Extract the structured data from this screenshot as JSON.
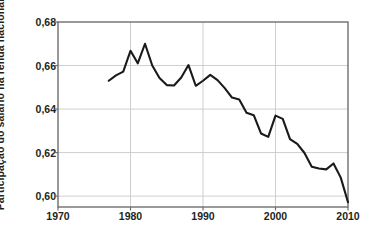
{
  "chart_data": {
    "type": "line",
    "title": "",
    "subtitle": "",
    "xlabel": "",
    "ylabel": "Participação do salário na renda nacional",
    "xlim": [
      1970,
      2010
    ],
    "ylim": [
      0.595,
      0.68
    ],
    "xticks": [
      1970,
      1980,
      1990,
      2000,
      2010
    ],
    "xtick_labels": [
      "1970",
      "1980",
      "1990",
      "2000",
      "2010"
    ],
    "yticks": [
      0.6,
      0.62,
      0.64,
      0.66,
      0.68
    ],
    "ytick_labels": [
      "0,60",
      "0,62",
      "0,64",
      "0,66",
      "0,68"
    ],
    "grid": true,
    "grid_axis": "both",
    "legend": false,
    "legend_position": "none",
    "decimal_separator": ",",
    "line_color": "#1a1a1a",
    "line_width": 2.1,
    "grid_color": "#c9c9c9",
    "axis_color": "#6e6e6e",
    "background": "#ffffff",
    "x": [
      1977,
      1978,
      1979,
      1980,
      1981,
      1982,
      1983,
      1984,
      1985,
      1986,
      1987,
      1988,
      1989,
      1990,
      1991,
      1992,
      1993,
      1994,
      1995,
      1996,
      1997,
      1998,
      1999,
      2000,
      2001,
      2002,
      2003,
      2004,
      2005,
      2006,
      2007,
      2008,
      2009,
      2010
    ],
    "values": [
      0.653,
      0.6555,
      0.6572,
      0.6668,
      0.661,
      0.67,
      0.66,
      0.6543,
      0.651,
      0.6508,
      0.6545,
      0.6602,
      0.6507,
      0.653,
      0.6557,
      0.6533,
      0.6496,
      0.6453,
      0.6444,
      0.6383,
      0.6372,
      0.6288,
      0.6272,
      0.637,
      0.6355,
      0.6262,
      0.624,
      0.6198,
      0.6135,
      0.6127,
      0.6123,
      0.615,
      0.6085,
      0.5972
    ],
    "series": [
      {
        "name": "Participação do salário na renda nacional",
        "values": [
          0.653,
          0.6555,
          0.6572,
          0.6668,
          0.661,
          0.67,
          0.66,
          0.6543,
          0.651,
          0.6508,
          0.6545,
          0.6602,
          0.6507,
          0.653,
          0.6557,
          0.6533,
          0.6496,
          0.6453,
          0.6444,
          0.6383,
          0.6372,
          0.6288,
          0.6272,
          0.637,
          0.6355,
          0.6262,
          0.624,
          0.6198,
          0.6135,
          0.6127,
          0.6123,
          0.615,
          0.6085,
          0.5972
        ]
      }
    ],
    "annotations": []
  }
}
